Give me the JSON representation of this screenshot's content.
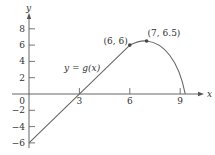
{
  "chart_data": {
    "type": "line",
    "title": "",
    "function_label": "y = g(x)",
    "xlabel": "x",
    "ylabel": "y",
    "xlim": [
      -1.7,
      10.8
    ],
    "ylim": [
      -7,
      10.5
    ],
    "grid": false,
    "x_ticks": [
      3,
      6,
      9
    ],
    "x_tick_labels": [
      "3",
      "6",
      "9"
    ],
    "y_ticks": [
      8,
      6,
      4,
      2,
      -2,
      -4,
      -6
    ],
    "y_tick_labels": [
      "8",
      "6",
      "4",
      "2",
      "−2",
      "−4",
      "−6"
    ],
    "origin_label": "0",
    "series": [
      {
        "name": "g(x)",
        "segments": [
          {
            "kind": "line",
            "from": [
              0,
              -6
            ],
            "to": [
              6,
              6
            ]
          },
          {
            "kind": "curve",
            "points": [
              [
                6,
                6
              ],
              [
                7,
                6.5
              ],
              [
                8,
                5
              ],
              [
                9,
                1.5
              ],
              [
                9.3,
                0
              ]
            ]
          }
        ]
      }
    ],
    "marked_points": [
      {
        "x": 6,
        "y": 6,
        "label": "(6, 6)"
      },
      {
        "x": 7,
        "y": 6.5,
        "label": "(7, 6.5)"
      }
    ],
    "x_intercepts": [
      3,
      9.3
    ],
    "y_intercept": -6
  },
  "colors": {
    "axis": "#555555",
    "curve": "#666666",
    "point": "#444444",
    "text": "#333333"
  }
}
